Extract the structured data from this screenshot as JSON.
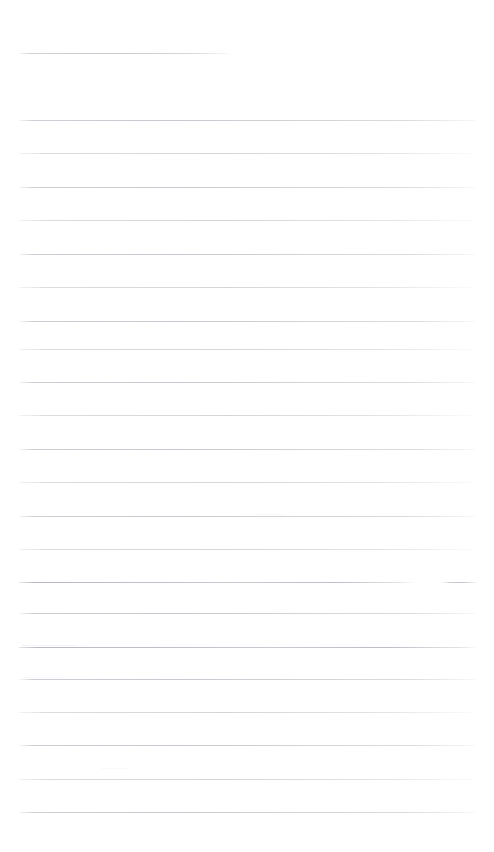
{
  "document": {
    "kind": "scanned-blank-ruled-page",
    "page_width": 494,
    "page_height": 852,
    "background_color": "#ffffff",
    "rule_color": "#d0d3d9",
    "visible_text": "",
    "body_text": "",
    "notes_text": ""
  },
  "rules": [
    {
      "name": "rule-0-top-short",
      "y": 53,
      "x": 19,
      "width": 213,
      "style": "short"
    },
    {
      "name": "rule-1",
      "y": 120,
      "x": 19,
      "width": 459,
      "style": "fade"
    },
    {
      "name": "rule-2",
      "y": 153,
      "x": 19,
      "width": 459,
      "style": "fade-soft"
    },
    {
      "name": "rule-3",
      "y": 187,
      "x": 19,
      "width": 459,
      "style": "fade"
    },
    {
      "name": "rule-4",
      "y": 220,
      "x": 19,
      "width": 459,
      "style": "fade-soft"
    },
    {
      "name": "rule-5",
      "y": 254,
      "x": 19,
      "width": 459,
      "style": "fade"
    },
    {
      "name": "rule-6",
      "y": 287,
      "x": 19,
      "width": 459,
      "style": "fade-soft"
    },
    {
      "name": "rule-7",
      "y": 321,
      "x": 19,
      "width": 459,
      "style": "fade"
    },
    {
      "name": "rule-8",
      "y": 349,
      "x": 19,
      "width": 459,
      "style": "fade-soft"
    },
    {
      "name": "rule-9",
      "y": 382,
      "x": 19,
      "width": 459,
      "style": "fade"
    },
    {
      "name": "rule-10",
      "y": 415,
      "x": 19,
      "width": 459,
      "style": "fade-soft"
    },
    {
      "name": "rule-11",
      "y": 449,
      "x": 19,
      "width": 459,
      "style": "fade"
    },
    {
      "name": "rule-12",
      "y": 482,
      "x": 19,
      "width": 459,
      "style": "fade-soft"
    },
    {
      "name": "rule-13",
      "y": 516,
      "x": 19,
      "width": 459,
      "style": "fade"
    },
    {
      "name": "rule-14",
      "y": 549,
      "x": 19,
      "width": 459,
      "style": "fade-soft"
    },
    {
      "name": "rule-15",
      "y": 582,
      "x": 19,
      "width": 396,
      "style": "fade-strong"
    },
    {
      "name": "rule-16",
      "y": 613,
      "x": 19,
      "width": 459,
      "style": "fade"
    },
    {
      "name": "rule-17",
      "y": 647,
      "x": 19,
      "width": 459,
      "style": "fade-strong"
    },
    {
      "name": "rule-18",
      "y": 679,
      "x": 19,
      "width": 459,
      "style": "fade"
    },
    {
      "name": "rule-19",
      "y": 712,
      "x": 19,
      "width": 459,
      "style": "fade-soft"
    },
    {
      "name": "rule-20",
      "y": 745,
      "x": 19,
      "width": 459,
      "style": "fade"
    },
    {
      "name": "rule-21",
      "y": 779,
      "x": 19,
      "width": 459,
      "style": "fade-soft"
    },
    {
      "name": "rule-22",
      "y": 812,
      "x": 19,
      "width": 459,
      "style": "fade"
    }
  ],
  "marks": [
    {
      "name": "right-edge-dash",
      "y": 582,
      "x": 441,
      "width": 37
    },
    {
      "name": "smudge-left-647",
      "y": 645,
      "x": 22,
      "width": 55,
      "opacity": 0.45
    },
    {
      "name": "smudge-left-679",
      "y": 677,
      "x": 22,
      "width": 42,
      "opacity": 0.3
    },
    {
      "name": "smudge-mid-516",
      "y": 514,
      "x": 255,
      "width": 30,
      "opacity": 0.28
    },
    {
      "name": "smudge-left-770",
      "y": 768,
      "x": 100,
      "width": 28,
      "opacity": 0.22
    }
  ],
  "gaps": [
    {
      "name": "gap-582-right",
      "y": 581,
      "x": 413,
      "width": 28
    }
  ]
}
